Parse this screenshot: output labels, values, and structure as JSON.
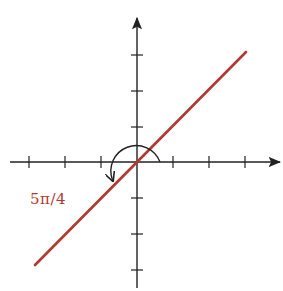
{
  "figure": {
    "angle_label": "5π/4",
    "colors": {
      "axes": "#222222",
      "line": "#b03a32",
      "arc": "#222222",
      "label": "#b03a32"
    },
    "origin_px": [
      137,
      162
    ],
    "tick_spacing_px": 36,
    "x_ticks": [
      -3,
      -2,
      -1,
      1,
      2,
      3
    ],
    "y_ticks": [
      -3,
      -2,
      -1,
      1,
      2,
      3
    ],
    "line_endpoints_px": [
      [
        35,
        265
      ],
      [
        246,
        52
      ]
    ],
    "arc": {
      "start_deg": 0,
      "end_deg": 225,
      "direction": "counterclockwise",
      "radius_px": 23
    }
  }
}
